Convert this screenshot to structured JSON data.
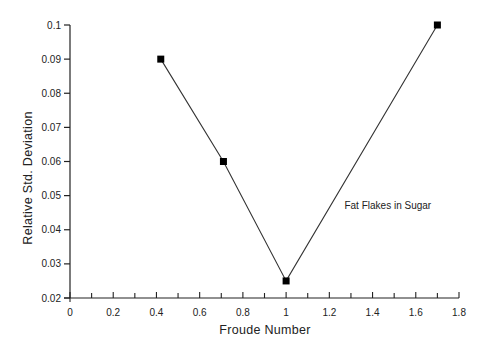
{
  "chart_data": {
    "type": "line",
    "title": "",
    "xlabel": "Froude Number",
    "ylabel": "Relative Std. Deviation",
    "xlim": [
      0,
      1.8
    ],
    "ylim": [
      0.02,
      0.1
    ],
    "x_ticks": [
      0,
      0.2,
      0.4,
      0.6,
      0.8,
      1,
      1.2,
      1.4,
      1.6,
      1.8
    ],
    "x_tick_labels": [
      "0",
      "0.2",
      "0.4",
      "0.6",
      "0.8",
      "1",
      "1.2",
      "1.4",
      "1.6",
      "1.8"
    ],
    "y_ticks": [
      0.02,
      0.03,
      0.04,
      0.05,
      0.06,
      0.07,
      0.08,
      0.09,
      0.1
    ],
    "y_tick_labels": [
      "0.02",
      "0.03",
      "0.04",
      "0.05",
      "0.06",
      "0.07",
      "0.08",
      "0.09",
      "0.1"
    ],
    "grid": false,
    "legend": null,
    "series": [
      {
        "name": "Fat Flakes in Sugar",
        "marker": "square",
        "color": "#000000",
        "x": [
          0.42,
          0.71,
          1.0,
          1.7
        ],
        "y": [
          0.09,
          0.06,
          0.025,
          0.1
        ]
      }
    ],
    "annotations": [
      {
        "text": "Fat Flakes in Sugar",
        "x": 1.27,
        "y": 0.046
      }
    ]
  }
}
